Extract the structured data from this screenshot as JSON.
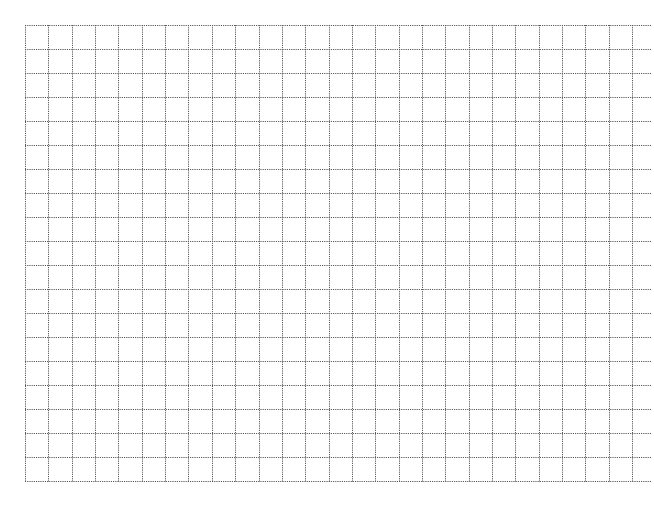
{
  "sheet": {
    "type": "grid-paper",
    "columns": 26,
    "rows": 19,
    "origin_x": 25,
    "origin_y": 25,
    "cell_width": 23.35,
    "cell_height": 24.0,
    "horizontal_line_extent_x": 652,
    "line_color": "#5a5a5a",
    "background_color": "#ffffff",
    "line_style": "dotted"
  }
}
